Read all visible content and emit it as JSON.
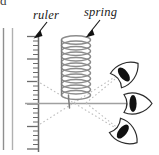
{
  "figure": {
    "kind": "physics-parallax-diagram",
    "labels": {
      "ruler": "ruler",
      "spring": "spring"
    },
    "clipped_text": "d",
    "colors": {
      "ink": "#1a1a1a",
      "ruler_gray": "#6b6b6b",
      "spring_gray": "#8a8a8a",
      "sightline_gray": "#b5b5b5",
      "axis_gray": "#9a9a9a",
      "margin_line_gray": "#9e9e9e",
      "eye_fill": "#111111",
      "background": "#ffffff"
    },
    "icons": {
      "ruler": "ruler-scale-icon",
      "spring": "coil-spring-icon",
      "eye_top": "eye-icon",
      "eye_middle": "eye-icon",
      "eye_bottom": "eye-icon",
      "pointer_ruler": "arrow-pointer-icon",
      "pointer_spring": "arrow-pointer-icon"
    },
    "elements": {
      "margin_lines": 2,
      "ruler_spine_x": 38,
      "ruler_ticks_total": 26,
      "ruler_major_every": 5,
      "spring_coils": 11,
      "eyes": 3,
      "sight_lines": 3,
      "reference_line": "horizontal"
    }
  }
}
